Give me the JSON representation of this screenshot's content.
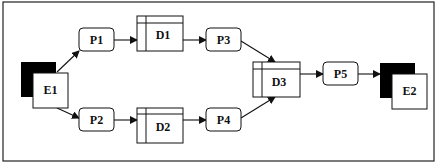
{
  "diagram": {
    "type": "data-flow-diagram",
    "entities": [
      {
        "id": "E1",
        "label": "E1"
      },
      {
        "id": "E2",
        "label": "E2"
      }
    ],
    "processes": [
      {
        "id": "P1",
        "label": "P1"
      },
      {
        "id": "P2",
        "label": "P2"
      },
      {
        "id": "P3",
        "label": "P3"
      },
      {
        "id": "P4",
        "label": "P4"
      },
      {
        "id": "P5",
        "label": "P5"
      }
    ],
    "data_stores": [
      {
        "id": "D1",
        "label": "D1"
      },
      {
        "id": "D2",
        "label": "D2"
      },
      {
        "id": "D3",
        "label": "D3"
      }
    ],
    "flows": [
      {
        "from": "E1",
        "to": "P1"
      },
      {
        "from": "E1",
        "to": "P2"
      },
      {
        "from": "P1",
        "to": "D1"
      },
      {
        "from": "P2",
        "to": "D2"
      },
      {
        "from": "D1",
        "to": "P3"
      },
      {
        "from": "D2",
        "to": "P4"
      },
      {
        "from": "P3",
        "to": "D3"
      },
      {
        "from": "P4",
        "to": "D3"
      },
      {
        "from": "D3",
        "to": "P5"
      },
      {
        "from": "P5",
        "to": "E2"
      }
    ],
    "colors": {
      "stroke": "#1a1a1a",
      "entity_shadow": "#000000",
      "fill": "#ffffff"
    }
  }
}
